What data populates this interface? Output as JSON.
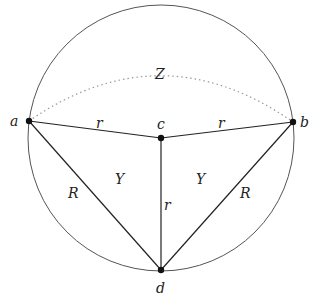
{
  "diagram": {
    "circle": {
      "cx": 161,
      "cy": 138,
      "r": 133,
      "stroke": "#555555"
    },
    "points": [
      {
        "id": "a",
        "label": "a",
        "x": 29,
        "y": 121,
        "lx": 14,
        "ly": 126
      },
      {
        "id": "b",
        "label": "b",
        "x": 293,
        "y": 122,
        "lx": 300,
        "ly": 127
      },
      {
        "id": "c",
        "label": "c",
        "x": 161,
        "y": 138,
        "lx": 157,
        "ly": 129
      },
      {
        "id": "d",
        "label": "d",
        "x": 161,
        "y": 270,
        "lx": 157,
        "ly": 292
      }
    ],
    "segments": [
      {
        "from": "a",
        "to": "c",
        "label": "r",
        "lx": 97,
        "ly": 128
      },
      {
        "from": "c",
        "to": "b",
        "label": "r",
        "lx": 219,
        "ly": 128
      },
      {
        "from": "c",
        "to": "d",
        "label": "r",
        "lx": 165,
        "ly": 208
      },
      {
        "from": "a",
        "to": "d",
        "label": "R",
        "lx": 70,
        "ly": 198
      },
      {
        "from": "b",
        "to": "d",
        "label": "R",
        "lx": 240,
        "ly": 198
      }
    ],
    "region_labels": [
      {
        "label": "Y",
        "x": 116,
        "y": 183
      },
      {
        "label": "Y",
        "x": 197,
        "y": 183
      }
    ],
    "arc": {
      "label": "Z",
      "lx": 156,
      "ly": 78,
      "color": "#999999"
    }
  }
}
